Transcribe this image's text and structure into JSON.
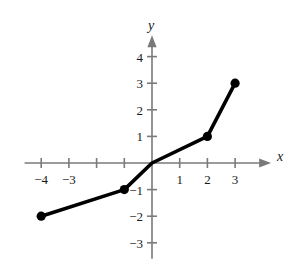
{
  "figure": {
    "width": 294,
    "height": 267,
    "background_color": "#ffffff"
  },
  "axes": {
    "x_axis_name": "x",
    "y_axis_name": "y",
    "axis_color": "#7a7a7a",
    "curve_color": "#000000",
    "x_tick_labels": [
      "-4",
      "-3",
      "1",
      "2",
      "3"
    ],
    "y_tick_labels": [
      "4",
      "3",
      "2",
      "1",
      "-1",
      "-2",
      "-3"
    ]
  },
  "chart_data": {
    "type": "line",
    "title": "",
    "xlabel": "x",
    "ylabel": "y",
    "xlim": [
      -4.6,
      4.3
    ],
    "ylim": [
      -3.6,
      4.8
    ],
    "grid": false,
    "legend": null,
    "x_ticks": [
      -4,
      -3,
      -2,
      -1,
      1,
      2,
      3
    ],
    "x_tick_labels_shown": [
      -4,
      -3,
      1,
      2,
      3
    ],
    "y_ticks": [
      4,
      3,
      2,
      1,
      -1,
      -2,
      -3
    ],
    "y_tick_labels_shown": [
      4,
      3,
      2,
      1,
      -1,
      -2,
      -3
    ],
    "series": [
      {
        "name": "piecewise linear function",
        "x": [
          -4,
          -1,
          0,
          2,
          3
        ],
        "y": [
          -2,
          -1,
          0,
          1,
          3
        ],
        "marker_points": [
          {
            "x": -4,
            "y": -2,
            "style": "filled-circle"
          },
          {
            "x": -1,
            "y": -1,
            "style": "filled-circle"
          },
          {
            "x": 2,
            "y": 1,
            "style": "filled-circle"
          },
          {
            "x": 3,
            "y": 3,
            "style": "filled-circle"
          }
        ],
        "segments": [
          {
            "from": [
              -4,
              -2
            ],
            "to": [
              2,
              1
            ],
            "slope": 0.5
          },
          {
            "from": [
              2,
              1
            ],
            "to": [
              3,
              3
            ],
            "slope": 2
          }
        ]
      }
    ]
  }
}
